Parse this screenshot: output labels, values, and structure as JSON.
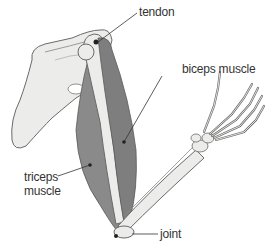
{
  "diagram": {
    "colors": {
      "bone_fill": "#ececea",
      "bone_stroke": "#6a6a6a",
      "muscle_fill": "#8a8a8a",
      "muscle_dark": "#6e6e6e",
      "label_text": "#333333",
      "leader_line": "#333333"
    },
    "labels": {
      "tendon": "tendon",
      "biceps": "biceps muscle",
      "triceps_line1": "triceps",
      "triceps_line2": "muscle",
      "joint": "joint"
    }
  }
}
